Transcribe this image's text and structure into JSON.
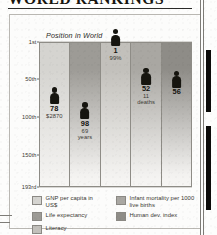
{
  "headline": "WORLD RANKINGS",
  "figure": {
    "axis_title": "Position in World",
    "y_ticks": [
      "1st",
      "50th",
      "100th",
      "150th",
      "193rd"
    ]
  },
  "legend": {
    "left_column": [
      {
        "label": "GNP per capita in US$",
        "color": "#d5d4d0"
      },
      {
        "label": "Life expectancy",
        "color": "#9d9b96"
      },
      {
        "label": "Literacy",
        "color": "#c2c0bb"
      }
    ],
    "right_column": [
      {
        "label": "Infant mortality per 1000 live births",
        "color": "#a9a7a2"
      },
      {
        "label": "Human dev. index",
        "color": "#8e8c87"
      }
    ]
  },
  "chart_data": {
    "type": "bar",
    "title": "WORLD RANKINGS",
    "subtitle": "Position in World",
    "xlabel": "",
    "ylabel": "Position in World",
    "ylim": [
      1,
      193
    ],
    "y_inverted": true,
    "y_ticks": [
      1,
      50,
      100,
      150,
      193
    ],
    "y_tick_labels": [
      "1st",
      "50th",
      "100th",
      "150th",
      "193rd"
    ],
    "grid": true,
    "legend_position": "bottom",
    "categories": [
      "GNP per capita in US$",
      "Life expectancy",
      "Literacy",
      "Infant mortality per 1000 live births",
      "Human dev. index"
    ],
    "values": [
      78,
      98,
      1,
      52,
      56
    ],
    "points": [
      {
        "category": "GNP per capita in US$",
        "rank": 78,
        "rank_label": "78",
        "value_label": "$2870",
        "column_color": "#d5d4d0"
      },
      {
        "category": "Life expectancy",
        "rank": 98,
        "rank_label": "98",
        "value_label": "69 years",
        "column_color": "#9d9b96"
      },
      {
        "category": "Literacy",
        "rank": 1,
        "rank_label": "1",
        "value_label": "99%",
        "column_color": "#c2c0bb"
      },
      {
        "category": "Infant mortality per 1000 live births",
        "rank": 52,
        "rank_label": "52",
        "value_label": "11 deaths",
        "column_color": "#a9a7a2"
      },
      {
        "category": "Human dev. index",
        "rank": 56,
        "rank_label": "56",
        "value_label": "",
        "column_color": "#8e8c87"
      }
    ]
  }
}
